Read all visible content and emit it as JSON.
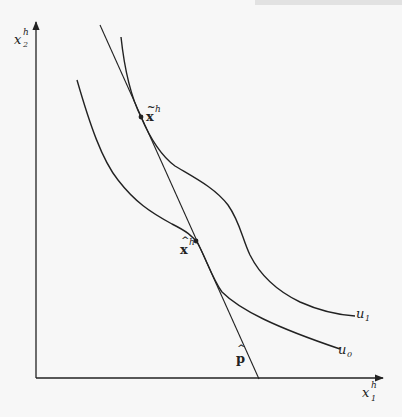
{
  "figure": {
    "axes": {
      "x_label": {
        "base": "x",
        "sup": "h",
        "sub": "1"
      },
      "y_label": {
        "base": "x",
        "sup": "h",
        "sub": "2"
      },
      "origin": [
        36,
        378
      ],
      "x_end": [
        383,
        378
      ],
      "y_end": [
        36,
        22
      ]
    },
    "curves": [
      {
        "id": "u0",
        "label": {
          "base": "u",
          "sub": "0"
        },
        "label_pos": [
          344,
          353
        ]
      },
      {
        "id": "u1",
        "label": {
          "base": "u",
          "sub": "1"
        },
        "label_pos": [
          362,
          317
        ]
      }
    ],
    "budget_line": {
      "label": {
        "base": "p",
        "accent": "^"
      },
      "label_pos": [
        236,
        360
      ],
      "from": [
        100,
        25
      ],
      "to": [
        259,
        379
      ]
    },
    "points": [
      {
        "id": "x-tilde",
        "label": {
          "base": "x",
          "accent": "~",
          "sup": "h"
        },
        "pos": [
          141,
          117
        ],
        "label_pos": [
          147,
          117
        ]
      },
      {
        "id": "x-hat",
        "label": {
          "base": "x",
          "accent": "^",
          "sup": "h"
        },
        "pos": [
          196,
          241
        ],
        "label_pos": [
          178,
          250
        ]
      }
    ],
    "colors": {
      "ink": "#222222",
      "background": "#f7f7f7"
    }
  }
}
